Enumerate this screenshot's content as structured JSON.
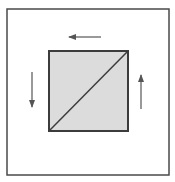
{
  "diagram": {
    "colors": {
      "background": "#ffffff",
      "stroke": "#4a4a4a",
      "inner_fill": "#dcdcdc",
      "arrow": "#555555"
    },
    "outer_square": {
      "x": 7,
      "y": 9,
      "width": 162,
      "height": 166
    },
    "inner_square": {
      "x": 49,
      "y": 51,
      "width": 79,
      "height": 80
    },
    "diagonal": {
      "x1": 49,
      "y1": 131,
      "x2": 128,
      "y2": 51
    },
    "arrows": [
      {
        "name": "top-arrow",
        "direction": "left",
        "x1": 101,
        "y1": 37,
        "x2": 69,
        "y2": 37
      },
      {
        "name": "left-arrow",
        "direction": "down",
        "x1": 32,
        "y1": 72,
        "x2": 32,
        "y2": 107
      },
      {
        "name": "right-arrow",
        "direction": "up",
        "x1": 141,
        "y1": 109,
        "x2": 141,
        "y2": 75
      }
    ]
  }
}
